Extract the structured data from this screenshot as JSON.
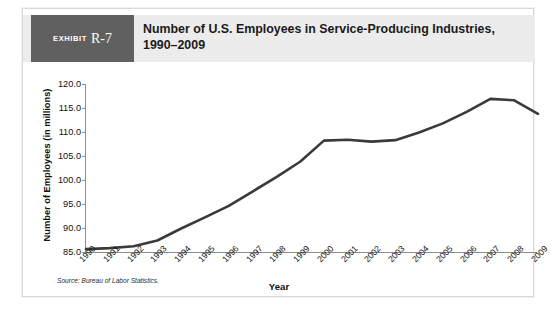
{
  "exhibit": {
    "word": "Exhibit",
    "number": "R-7"
  },
  "header": {
    "title": "Number of U.S. Employees in Service-Producing Industries, 1990–2009"
  },
  "source_note": "Source: Bureau of Labor Statistics.",
  "colors": {
    "badge_background": "#606060",
    "header_band": "#ececec",
    "series_line": "#3a3a3a",
    "axis": "#8c8c8c",
    "text": "#111111",
    "page_background": "#ffffff"
  },
  "chart_data": {
    "type": "line",
    "title": "Number of U.S. Employees in Service-Producing Industries, 1990–2009",
    "xlabel": "Year",
    "ylabel": "Number of Employees (in millions)",
    "xlim": [
      1990,
      2009
    ],
    "ylim": [
      85.0,
      120.0
    ],
    "yticks": [
      "85.0",
      "90.0",
      "95.0",
      "100.0",
      "105.0",
      "110.0",
      "115.0",
      "120.0"
    ],
    "ytick_values": [
      85.0,
      90.0,
      95.0,
      100.0,
      105.0,
      110.0,
      115.0,
      120.0
    ],
    "grid": false,
    "legend": null,
    "legend_position": "none",
    "categories": [
      "1990",
      "1991",
      "1992",
      "1993",
      "1994",
      "1995",
      "1996",
      "1997",
      "1998",
      "1999",
      "2000",
      "2001",
      "2002",
      "2003",
      "2004",
      "2005",
      "2006",
      "2007",
      "2008",
      "2009"
    ],
    "x": [
      1990,
      1991,
      1992,
      1993,
      1994,
      1995,
      1996,
      1997,
      1998,
      1999,
      2000,
      2001,
      2002,
      2003,
      2004,
      2005,
      2006,
      2007,
      2008,
      2009
    ],
    "values": [
      85.6,
      85.8,
      86.2,
      87.4,
      89.9,
      92.2,
      94.6,
      97.6,
      100.6,
      103.8,
      108.2,
      108.4,
      108.0,
      108.3,
      109.9,
      111.8,
      114.2,
      116.9,
      116.6,
      113.8
    ],
    "series": [
      {
        "name": "U.S. employees in service-producing industries (millions)",
        "values": [
          85.6,
          85.8,
          86.2,
          87.4,
          89.9,
          92.2,
          94.6,
          97.6,
          100.6,
          103.8,
          108.2,
          108.4,
          108.0,
          108.3,
          109.9,
          111.8,
          114.2,
          116.9,
          116.6,
          113.8
        ]
      }
    ],
    "annotations": []
  }
}
